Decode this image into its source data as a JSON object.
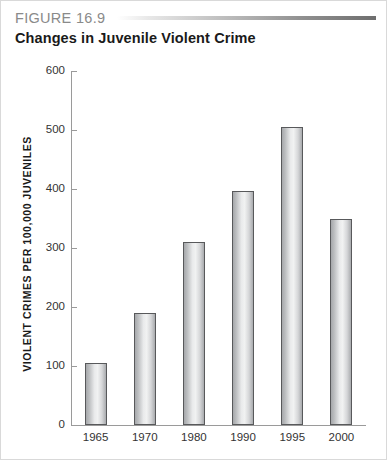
{
  "header": {
    "figure_label": "FIGURE 16.9",
    "title": "Changes in Juvenile Violent Crime"
  },
  "chart_data": {
    "type": "bar",
    "title": "Changes in Juvenile Violent Crime",
    "xlabel": "",
    "ylabel": "VIOLENT CRIMES PER 100,000 JUVENILES",
    "categories": [
      "1965",
      "1970",
      "1980",
      "1990",
      "1995",
      "2000"
    ],
    "values": [
      105,
      190,
      310,
      397,
      505,
      350
    ],
    "ylim": [
      0,
      600
    ],
    "yticks": [
      0,
      100,
      200,
      300,
      400,
      500,
      600
    ],
    "ytick_labels": [
      "0",
      "100",
      "200",
      "300",
      "400",
      "500",
      "600"
    ],
    "grid": false,
    "legend": null,
    "bar_color": "#e9eaeb",
    "bar_edge_color": "#58595b",
    "axis_color": "#9a9a9a"
  }
}
